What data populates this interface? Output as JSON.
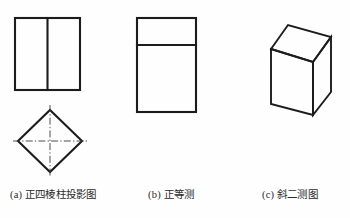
{
  "page": {
    "background_color": "#fefefe",
    "line_color": "#1c1c1c",
    "centerline_color": "#3a3a3a",
    "text_color": "#2b2b2b",
    "width": 350,
    "height": 218
  },
  "captions": {
    "a": "(a) 正四棱柱投影图",
    "b": "(b) 正等测",
    "c": "(c) 斜二测图"
  },
  "figures": [
    {
      "id": "a",
      "name": "orthographic-projection",
      "label": "(a) 正四棱柱投影图",
      "parts": [
        {
          "name": "front-view-rectangle",
          "shape": "rectangle",
          "x": 15,
          "y": 18,
          "width": 65,
          "height": 72
        },
        {
          "name": "front-view-divider",
          "shape": "line",
          "x1": 47,
          "y1": 18,
          "x2": 47,
          "y2": 90
        },
        {
          "name": "top-view-diamond",
          "shape": "polygon",
          "points": "50,110 82,141 50,172 18,141"
        },
        {
          "name": "top-view-horizontal-centerline",
          "shape": "line",
          "x1": 13,
          "y1": 141,
          "x2": 87,
          "y2": 141
        },
        {
          "name": "top-view-vertical-centerline",
          "shape": "line",
          "x1": 50,
          "y1": 105,
          "x2": 50,
          "y2": 177
        }
      ]
    },
    {
      "id": "b",
      "name": "isometric-view",
      "label": "(b) 正等测",
      "parts": [
        {
          "name": "isometric-outer-rectangle",
          "shape": "rectangle",
          "x": 137,
          "y": 18,
          "width": 59,
          "height": 94
        },
        {
          "name": "isometric-top-divider",
          "shape": "line",
          "x1": 137,
          "y1": 45,
          "x2": 196,
          "y2": 45
        }
      ]
    },
    {
      "id": "c",
      "name": "oblique-view",
      "label": "(c) 斜二测图",
      "parts": [
        {
          "name": "oblique-box-front-face",
          "shape": "polygon",
          "points": "271,49 313,62 313,115 271,104"
        },
        {
          "name": "oblique-box-top-face",
          "shape": "polygon",
          "points": "271,49 288,25 331,37 313,62"
        },
        {
          "name": "oblique-box-right-face",
          "shape": "polygon",
          "points": "313,62 331,37 331,92 313,115"
        }
      ]
    }
  ]
}
